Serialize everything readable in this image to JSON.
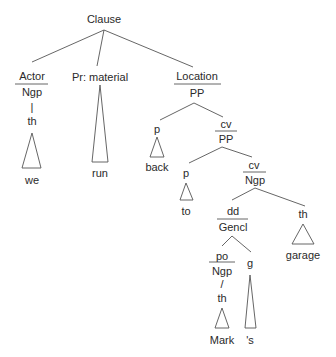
{
  "diagram": {
    "type": "syntax-tree",
    "root": "Clause",
    "nodes": {
      "clause": {
        "label": "Clause"
      },
      "actor": {
        "function": "Actor",
        "class": "Ngp",
        "head": "th",
        "word": "we"
      },
      "process": {
        "function": "Pr: material",
        "word": "run"
      },
      "location": {
        "function": "Location",
        "class": "PP"
      },
      "loc_p": {
        "function": "p",
        "word": "back"
      },
      "loc_cv": {
        "function": "cv",
        "class": "PP"
      },
      "cv_p": {
        "function": "p",
        "word": "to"
      },
      "cv_ngp": {
        "function": "cv",
        "class": "Ngp"
      },
      "dd": {
        "function": "dd",
        "class": "Gencl"
      },
      "th_garage": {
        "function": "th",
        "word": "garage"
      },
      "po": {
        "function": "po",
        "class": "Ngp",
        "head": "th",
        "word": "Mark"
      },
      "g": {
        "function": "g",
        "word": "'s"
      }
    },
    "connector_slash": "/",
    "connector_bar": "|"
  },
  "colors": {
    "line": "#555555",
    "text": "#2a2a2a",
    "background": "#ffffff"
  }
}
